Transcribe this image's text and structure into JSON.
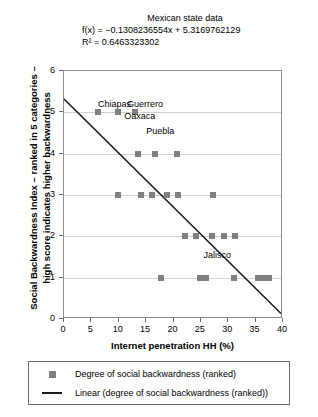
{
  "chart_data": {
    "type": "scatter",
    "title": "Mexican state data",
    "equation": "f(x) = −0.1308236554x + 5.3169762129",
    "r_squared": "R² = 0.6463323302",
    "xlabel": "Internet penetration HH (%)",
    "ylabel": "Social Backwardness Index – ranked in 5 categories – high score indicates higher backwardness",
    "ylabel_line1": "Social Backwardness Index – ranked in 5 categories –",
    "ylabel_line2": "high score indicates higher backwardness",
    "xlim": [
      0,
      40
    ],
    "ylim": [
      0,
      6
    ],
    "xticks": [
      0,
      5,
      10,
      15,
      20,
      25,
      30,
      35,
      40
    ],
    "yticks": [
      0,
      1,
      2,
      3,
      4,
      5,
      6
    ],
    "grid": "horizontal",
    "marker_color": "#808080",
    "line_color": "#1a1a1a",
    "trend": {
      "slope": -0.1308236554,
      "intercept": 5.3169762129,
      "x_start": 0,
      "y_start": 5.3169762129,
      "x_end": 40,
      "y_end": 0.0840299969
    },
    "points": [
      {
        "x": 6.2,
        "y": 5
      },
      {
        "x": 9.9,
        "y": 5
      },
      {
        "x": 13.0,
        "y": 5
      },
      {
        "x": 13.5,
        "y": 4
      },
      {
        "x": 16.6,
        "y": 4
      },
      {
        "x": 20.6,
        "y": 4
      },
      {
        "x": 9.9,
        "y": 3
      },
      {
        "x": 14.1,
        "y": 3
      },
      {
        "x": 16.1,
        "y": 3
      },
      {
        "x": 18.8,
        "y": 3
      },
      {
        "x": 20.8,
        "y": 3
      },
      {
        "x": 27.2,
        "y": 3
      },
      {
        "x": 22.1,
        "y": 2
      },
      {
        "x": 24.2,
        "y": 2
      },
      {
        "x": 27.1,
        "y": 2
      },
      {
        "x": 29.3,
        "y": 2
      },
      {
        "x": 31.2,
        "y": 2
      },
      {
        "x": 17.8,
        "y": 1
      },
      {
        "x": 24.8,
        "y": 1
      },
      {
        "x": 26.0,
        "y": 1
      },
      {
        "x": 31.0,
        "y": 1
      },
      {
        "x": 35.4,
        "y": 1
      },
      {
        "x": 36.4,
        "y": 1
      },
      {
        "x": 37.4,
        "y": 1
      }
    ],
    "annotations": [
      {
        "label": "Chiapas",
        "x": 6.2,
        "y": 5
      },
      {
        "label": "Guerrero",
        "x": 11.5,
        "y": 5
      },
      {
        "label": "Oaxaca",
        "x": 11.0,
        "y": 4.72
      },
      {
        "label": "Puebla",
        "x": 15.0,
        "y": 4.35
      },
      {
        "label": "Jalisco",
        "x": 25.5,
        "y": 1.35
      }
    ],
    "legend": {
      "position": "bottom",
      "items": [
        {
          "key": "marker",
          "label": "Degree of social backwardness (ranked)"
        },
        {
          "key": "line",
          "label": "Linear (degree of social backwardness (ranked))"
        }
      ]
    }
  }
}
